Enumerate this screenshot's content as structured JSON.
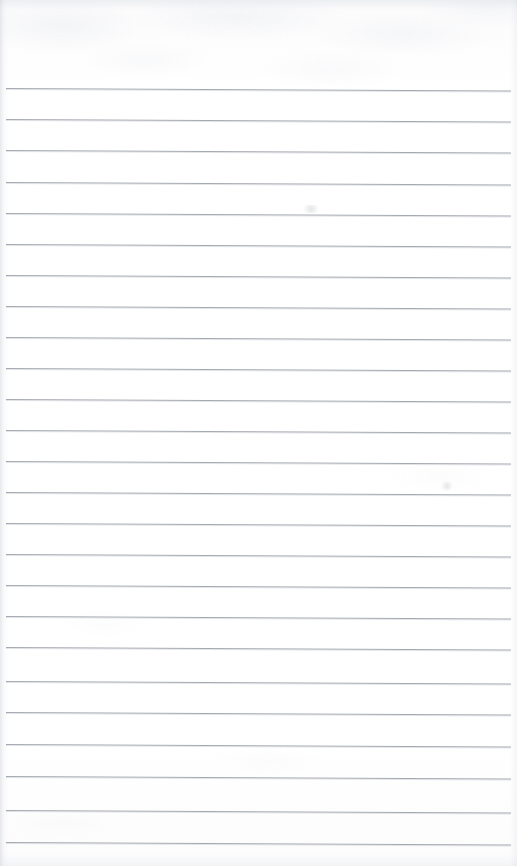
{
  "document": {
    "kind": "scanned-blank-lined-notebook-page",
    "title": "Lined Notebook Page",
    "page_width": 517,
    "page_height": 866,
    "paper_color": "#fdfdfe",
    "rule_color": "#9ea3ab",
    "has_text_content": false,
    "has_handwriting": false,
    "has_margin_rule": false,
    "notes_text": ""
  },
  "ruling": {
    "line_count": 25,
    "line_spacing_px": 31,
    "first_line_y": 88,
    "last_line_y": 842,
    "line_thickness_px": 1,
    "left_inset_px": 5,
    "right_inset_px": 6,
    "tilt_deg": 0.28,
    "lines": [
      {
        "index": 1,
        "y": 88,
        "x1": 6,
        "x2": 511
      },
      {
        "index": 2,
        "y": 119,
        "x1": 6,
        "x2": 511
      },
      {
        "index": 3,
        "y": 150,
        "x1": 6,
        "x2": 511
      },
      {
        "index": 4,
        "y": 182,
        "x1": 6,
        "x2": 511
      },
      {
        "index": 5,
        "y": 213,
        "x1": 6,
        "x2": 511
      },
      {
        "index": 6,
        "y": 244,
        "x1": 6,
        "x2": 511
      },
      {
        "index": 7,
        "y": 275,
        "x1": 6,
        "x2": 511
      },
      {
        "index": 8,
        "y": 306,
        "x1": 6,
        "x2": 511
      },
      {
        "index": 9,
        "y": 337,
        "x1": 6,
        "x2": 511
      },
      {
        "index": 10,
        "y": 368,
        "x1": 6,
        "x2": 511
      },
      {
        "index": 11,
        "y": 399,
        "x1": 6,
        "x2": 511
      },
      {
        "index": 12,
        "y": 430,
        "x1": 6,
        "x2": 511
      },
      {
        "index": 13,
        "y": 461,
        "x1": 6,
        "x2": 511
      },
      {
        "index": 14,
        "y": 492,
        "x1": 6,
        "x2": 511
      },
      {
        "index": 15,
        "y": 523,
        "x1": 6,
        "x2": 511
      },
      {
        "index": 16,
        "y": 554,
        "x1": 6,
        "x2": 511
      },
      {
        "index": 17,
        "y": 585,
        "x1": 6,
        "x2": 511
      },
      {
        "index": 18,
        "y": 616,
        "x1": 6,
        "x2": 511
      },
      {
        "index": 19,
        "y": 647,
        "x1": 6,
        "x2": 511
      },
      {
        "index": 20,
        "y": 681,
        "x1": 6,
        "x2": 511
      },
      {
        "index": 21,
        "y": 712,
        "x1": 6,
        "x2": 511
      },
      {
        "index": 22,
        "y": 744,
        "x1": 6,
        "x2": 511
      },
      {
        "index": 23,
        "y": 776,
        "x1": 6,
        "x2": 511
      },
      {
        "index": 24,
        "y": 810,
        "x1": 6,
        "x2": 511
      },
      {
        "index": 25,
        "y": 842,
        "x1": 6,
        "x2": 511
      }
    ]
  },
  "artifacts": {
    "smudges": [
      {
        "x": 440,
        "y": 481,
        "w": 14,
        "h": 10
      },
      {
        "x": 300,
        "y": 205,
        "w": 22,
        "h": 8
      }
    ]
  }
}
